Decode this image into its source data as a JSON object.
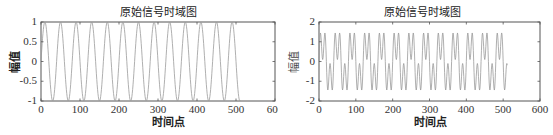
{
  "chart_data": [
    {
      "type": "line",
      "title": "原始信号时域图",
      "xlabel": "时间点",
      "ylabel": "幅值",
      "xlim": [
        0,
        600
      ],
      "ylim": [
        -1,
        1
      ],
      "xticks": [
        "0",
        "100",
        "200",
        "300",
        "400",
        "500",
        "600"
      ],
      "yticks": [
        "-1",
        "-0.5",
        "0",
        "0.5",
        "1"
      ],
      "grid": false,
      "legend": null,
      "series": [
        {
          "name": "signal",
          "description": "sinusoid, amplitude 1, period ~40 samples, 512 samples",
          "n_points": 512,
          "period": 40,
          "amplitude": 1,
          "components": [
            {
              "amplitude": 1,
              "period": 40
            }
          ],
          "color": "#9a9a9a"
        }
      ]
    },
    {
      "type": "line",
      "title": "原始信号时域图",
      "xlabel": "时间点",
      "ylabel": "幅值",
      "xlim": [
        0,
        600
      ],
      "ylim": [
        -2,
        2
      ],
      "xticks": [
        "0",
        "100",
        "200",
        "300",
        "400",
        "500",
        "600"
      ],
      "yticks": [
        "-2",
        "-1",
        "0",
        "1",
        "2"
      ],
      "grid": false,
      "legend": null,
      "series": [
        {
          "name": "signal",
          "description": "sum of two sinusoids (period ~40 and ~13.3 samples), peaks near ±1.9, 512 samples",
          "n_points": 512,
          "components": [
            {
              "amplitude": 1,
              "period": 40
            },
            {
              "amplitude": 0.9,
              "period": 13.333
            }
          ],
          "color": "#9a9a9a"
        }
      ]
    }
  ],
  "charts": [
    {
      "title": "原始信号时域图",
      "xlabel": "时间点",
      "ylabel": "幅值",
      "xticks": [
        "0",
        "100",
        "200",
        "300",
        "400",
        "500",
        "600"
      ],
      "yticks": [
        "1",
        "0.5",
        "0",
        "-0.5",
        "-1"
      ]
    },
    {
      "title": "原始信号时域图",
      "xlabel": "时间点",
      "ylabel": "幅值",
      "xticks": [
        "0",
        "100",
        "200",
        "300",
        "400",
        "500",
        "600"
      ],
      "yticks": [
        "2",
        "1",
        "0",
        "-1",
        "-2"
      ]
    }
  ]
}
